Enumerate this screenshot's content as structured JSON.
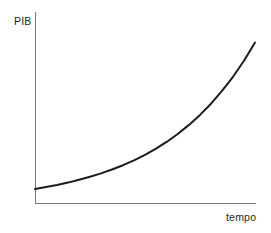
{
  "chart_data": {
    "type": "line",
    "title": "",
    "xlabel": "tempo",
    "ylabel": "PIB",
    "x": [
      0,
      0.05,
      0.1,
      0.15,
      0.2,
      0.25,
      0.3,
      0.35,
      0.4,
      0.45,
      0.5,
      0.55,
      0.6,
      0.65,
      0.7,
      0.75,
      0.8,
      0.85,
      0.9,
      0.95,
      1
    ],
    "y": [
      0.087,
      0.099,
      0.112,
      0.127,
      0.144,
      0.163,
      0.184,
      0.208,
      0.235,
      0.265,
      0.299,
      0.338,
      0.381,
      0.43,
      0.485,
      0.547,
      0.617,
      0.696,
      0.784,
      0.884,
      0.997
    ],
    "xlim": [
      0,
      1
    ],
    "ylim": [
      0,
      1
    ],
    "grid": false,
    "legend": "none",
    "ticks": "none",
    "series": [
      {
        "name": "PIB",
        "style": "solid black curve, exponential growth"
      }
    ]
  },
  "colors": {
    "background": "#ffffff",
    "axis": "#7a7a7a",
    "curve": "#1c1c1c",
    "text": "#1f1f1f"
  }
}
